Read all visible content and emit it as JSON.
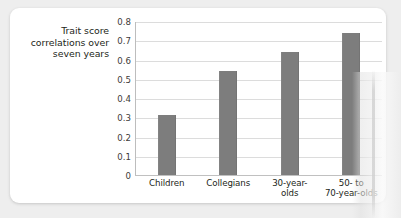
{
  "figure": {
    "axis_caption_lines": [
      "Trait score",
      "correlations over",
      "seven years"
    ]
  },
  "chart_data": {
    "type": "bar",
    "title": "",
    "xlabel": "",
    "ylabel": "Trait score correlations over seven years",
    "categories": [
      "Children",
      "Collegians",
      "30-year-olds",
      "50- to 70-year-olds"
    ],
    "category_label_lines": [
      [
        "Children"
      ],
      [
        "Collegians"
      ],
      [
        "30-year-",
        "olds"
      ],
      [
        "50- to",
        "70-year-olds"
      ]
    ],
    "values": [
      0.31,
      0.54,
      0.64,
      0.74
    ],
    "ylim": [
      0,
      0.8
    ],
    "ytick_labels": [
      "0.8",
      "0.7",
      "0.6",
      "0.5",
      "0.4",
      "0.3",
      "0.2",
      "0.1",
      "0"
    ],
    "ytick_values": [
      0.8,
      0.7,
      0.6,
      0.5,
      0.4,
      0.3,
      0.2,
      0.1,
      0
    ],
    "grid": true,
    "legend": false,
    "bar_color": "#7d7d7d",
    "gridline_color": "#dcdcdc",
    "axis_color": "#bdbdbd",
    "plot_background": "#ffffff"
  }
}
